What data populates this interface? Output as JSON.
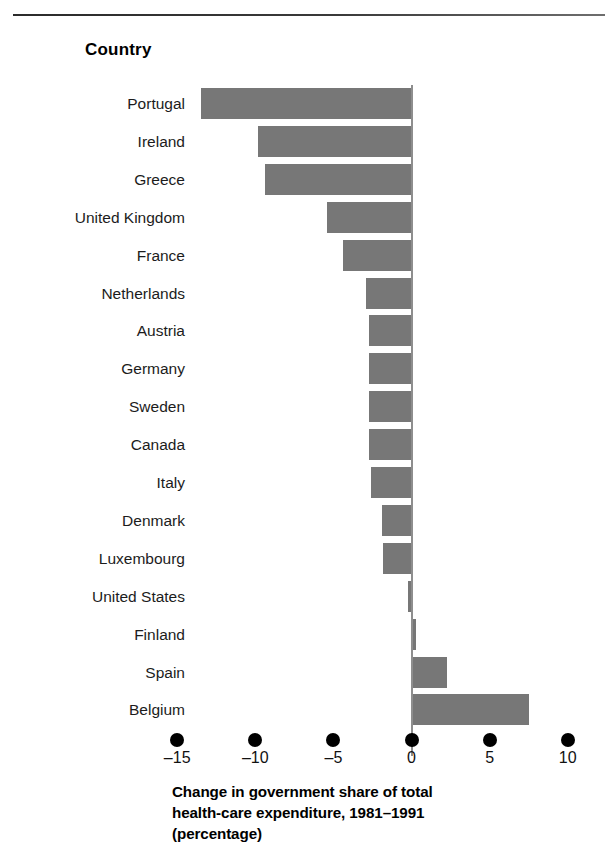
{
  "header": {
    "column_label": "Country"
  },
  "caption": {
    "line1": "Change in government share of total",
    "line2": "health-care expenditure, 1981–1991",
    "line3": "(percentage)"
  },
  "axis": {
    "tick_labels": [
      "–15",
      "–10",
      "–5",
      "0",
      "5",
      "10"
    ],
    "tick_values": [
      -15,
      -10,
      -5,
      0,
      5,
      10
    ]
  },
  "colors": {
    "bar": "#777777",
    "axis_line": "#8e8e8e",
    "tick_dot": "#000000",
    "text": "#1c1c1c",
    "background": "#ffffff"
  },
  "chart_data": {
    "type": "bar",
    "orientation": "horizontal",
    "title": "",
    "xlabel": "Change in government share of total health-care expenditure, 1981–1991 (percentage)",
    "ylabel": "Country",
    "xlim": [
      -15,
      10
    ],
    "xticks": [
      -15,
      -10,
      -5,
      0,
      5,
      10
    ],
    "grid": false,
    "legend": "none",
    "categories": [
      "Portugal",
      "Ireland",
      "Greece",
      "United Kingdom",
      "France",
      "Netherlands",
      "Austria",
      "Germany",
      "Sweden",
      "Canada",
      "Italy",
      "Denmark",
      "Luxembourg",
      "United States",
      "Finland",
      "Spain",
      "Belgium"
    ],
    "values": [
      -13.5,
      -9.8,
      -9.4,
      -5.4,
      -4.4,
      -2.9,
      -2.7,
      -2.7,
      -2.7,
      -2.7,
      -2.6,
      -1.9,
      -1.8,
      -0.2,
      0.3,
      2.3,
      7.5
    ]
  }
}
